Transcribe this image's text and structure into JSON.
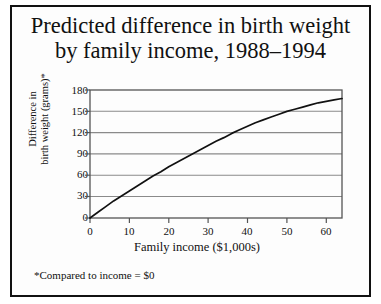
{
  "figure": {
    "title_line1": "Predicted difference in birth weight",
    "title_line2": "by family income, 1988–1994",
    "footnote": "*Compared to income = $0",
    "border_color": "#111111",
    "background": "#fdfdfd"
  },
  "chart_data": {
    "type": "line",
    "title": "Predicted difference in birth weight by family income, 1988–1994",
    "xlabel": "Family income ($1,000s)",
    "ylabel": "Difference in birth weight (grams)*",
    "ylabel_line1": "Difference in",
    "ylabel_line2": "birth weight (grams)*",
    "xlim": [
      0,
      64
    ],
    "ylim": [
      0,
      180
    ],
    "xticks": [
      0,
      10,
      20,
      30,
      40,
      50,
      60
    ],
    "yticks": [
      0,
      30,
      60,
      90,
      120,
      150,
      180
    ],
    "grid": "horizontal",
    "legend": "none",
    "line_color": "#111111",
    "grid_color": "#8a8a8a",
    "axis_color": "#555555",
    "series": [
      {
        "name": "Predicted difference in birth weight",
        "x": [
          0,
          2,
          4,
          6,
          8,
          10,
          12,
          14,
          16,
          18,
          20,
          22,
          24,
          26,
          28,
          30,
          32,
          34,
          36,
          38,
          40,
          42,
          44,
          46,
          48,
          50,
          52,
          54,
          56,
          58,
          60,
          62,
          64
        ],
        "values": [
          0,
          8,
          16,
          24,
          31,
          38,
          45,
          52,
          59,
          65,
          72,
          78,
          84,
          90,
          96,
          102,
          108,
          113,
          119,
          124,
          129,
          134,
          138,
          142,
          146,
          150,
          153,
          156,
          159,
          162,
          164,
          166,
          168
        ]
      }
    ],
    "annotations": [
      "*Compared to income = $0"
    ]
  },
  "ticks": {
    "y": [
      "180",
      "150",
      "120",
      "90",
      "60",
      "30",
      "0"
    ],
    "x": [
      "0",
      "10",
      "20",
      "30",
      "40",
      "50",
      "60"
    ]
  },
  "axis_titles": {
    "x": "Family income ($1,000s)",
    "y_line1": "Difference in",
    "y_line2": "birth weight (grams)*"
  }
}
